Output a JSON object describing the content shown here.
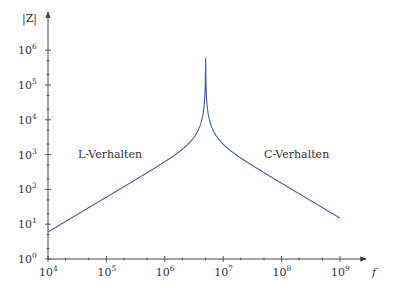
{
  "chart_data": {
    "type": "line",
    "title": "",
    "xlabel": "f",
    "ylabel": "|Z|",
    "xscale": "log",
    "yscale": "log",
    "xlim": [
      10000,
      1000000000
    ],
    "ylim": [
      1,
      1000000
    ],
    "x_ticks": [
      {
        "base": "10",
        "exp": "4",
        "value": 10000
      },
      {
        "base": "10",
        "exp": "5",
        "value": 100000
      },
      {
        "base": "10",
        "exp": "6",
        "value": 1000000
      },
      {
        "base": "10",
        "exp": "7",
        "value": 10000000
      },
      {
        "base": "10",
        "exp": "8",
        "value": 100000000
      },
      {
        "base": "10",
        "exp": "9",
        "value": 1000000000
      }
    ],
    "y_ticks": [
      {
        "base": "10",
        "exp": "0",
        "value": 1
      },
      {
        "base": "10",
        "exp": "1",
        "value": 10
      },
      {
        "base": "10",
        "exp": "2",
        "value": 100
      },
      {
        "base": "10",
        "exp": "3",
        "value": 1000
      },
      {
        "base": "10",
        "exp": "4",
        "value": 10000
      },
      {
        "base": "10",
        "exp": "5",
        "value": 100000
      },
      {
        "base": "10",
        "exp": "6",
        "value": 1000000
      }
    ],
    "grid": false,
    "legend": null,
    "annotations": [
      {
        "text": "L-Verhalten",
        "x": 300000,
        "y": 1000
      },
      {
        "text": "C-Verhalten",
        "x": 60000000,
        "y": 1000
      }
    ],
    "series": [
      {
        "name": "|Z|(f) parallel LC",
        "color": "#4a5a9c",
        "x": [
          10000,
          100000,
          1000000,
          3000000,
          4500000,
          4900000,
          5000000,
          5500000,
          7000000,
          10000000,
          100000000,
          1000000000
        ],
        "y": [
          6,
          60,
          650,
          3000,
          25000,
          600000,
          300000,
          20000,
          3000,
          1500,
          150,
          15
        ]
      }
    ],
    "resonance_frequency_hz": 4900000,
    "peak_value": 600000
  },
  "colors": {
    "curve": "#4a5a9c",
    "axis": "#333333",
    "text": "#333333"
  }
}
